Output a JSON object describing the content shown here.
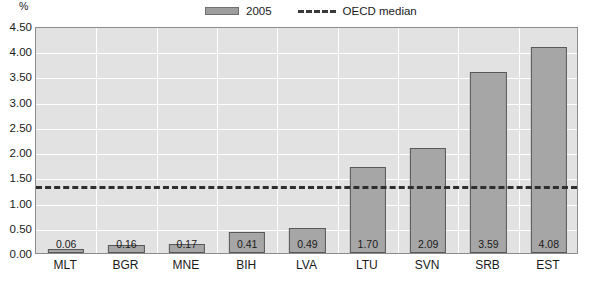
{
  "chart_data": {
    "type": "bar",
    "title": "",
    "subtitle": "",
    "xlabel": "",
    "ylabel": "%",
    "categories": [
      "MLT",
      "BGR",
      "MNE",
      "BIH",
      "LVA",
      "LTU",
      "SVN",
      "SRB",
      "EST"
    ],
    "series": [
      {
        "name": "2005",
        "values": [
          0.06,
          0.16,
          0.17,
          0.41,
          0.49,
          1.7,
          2.09,
          3.59,
          4.08
        ],
        "value_labels": [
          "0.06",
          "0.16",
          "0.17",
          "0.41",
          "0.49",
          "1.70",
          "2.09",
          "3.59",
          "4.08"
        ],
        "color": "#a6a6a6",
        "border_color": "#585858"
      }
    ],
    "reference_lines": [
      {
        "name": "OECD median",
        "value": 1.37,
        "style": "dashed",
        "color": "#2e2e2e"
      }
    ],
    "ylim": [
      0.0,
      4.5
    ],
    "ytick_step": 0.5,
    "ytick_labels": [
      "4.50",
      "4.00",
      "3.50",
      "3.00",
      "2.50",
      "2.00",
      "1.50",
      "1.00",
      "0.50",
      "0.00"
    ],
    "ytick_values": [
      4.5,
      4.0,
      3.5,
      3.0,
      2.5,
      2.0,
      1.5,
      1.0,
      0.5,
      0.0
    ],
    "grid": {
      "horizontal": true,
      "vertical": true,
      "color": "#ffffff"
    },
    "plot_background": "#e2e2e2",
    "legend": {
      "position": "top-center",
      "entries": [
        {
          "label": "2005",
          "marker": "bar-swatch"
        },
        {
          "label": "OECD median",
          "marker": "dashed-line"
        }
      ]
    }
  },
  "axis": {
    "unit_label": "%"
  }
}
